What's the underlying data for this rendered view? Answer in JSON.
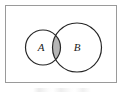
{
  "figure": {
    "kind": "venn-diagram",
    "title": "",
    "universe_label": "",
    "background_color": "#ffffff",
    "stroke_color": "#262626",
    "frame_color": "#9a9a9a",
    "shade_color": "#b5b5b5"
  },
  "frame": {
    "name": "universal-set-rectangle",
    "x": 5,
    "y": 5,
    "width": 112,
    "height": 78
  },
  "sets": [
    {
      "id": "A",
      "label": "A",
      "cx": 43,
      "cy": 47.5,
      "r": 17.5,
      "label_x": 41,
      "label_y": 48
    },
    {
      "id": "B",
      "label": "B",
      "cx": 77,
      "cy": 47.5,
      "r": 24.5,
      "label_x": 77,
      "label_y": 48
    }
  ],
  "intersection": {
    "name": "A-intersect-B",
    "label": "",
    "shaded": true,
    "fill": "#b5b5b5"
  },
  "caption": {
    "text": "",
    "visible_fragment": ""
  }
}
